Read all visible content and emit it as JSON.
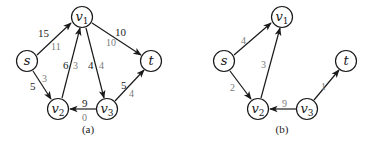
{
  "colors": {
    "edge": "#1a1a1a",
    "capacity_label": "#1a1a1a",
    "flow_label": "#7a7a7a",
    "background": "#ffffff"
  },
  "graph_a": {
    "caption": "(a)",
    "nodes": {
      "s": {
        "label": "s",
        "sub": ""
      },
      "v1": {
        "label": "v",
        "sub": "1"
      },
      "v2": {
        "label": "v",
        "sub": "2"
      },
      "v3": {
        "label": "v",
        "sub": "3"
      },
      "t": {
        "label": "t",
        "sub": ""
      }
    },
    "edges": {
      "s_v1": {
        "from": "s",
        "to": "v1",
        "capacity": "15",
        "flow": "11"
      },
      "s_v2": {
        "from": "s",
        "to": "v2",
        "capacity": "5",
        "flow": "3"
      },
      "v2_v1": {
        "from": "v2",
        "to": "v1",
        "capacity": "6",
        "flow": "3"
      },
      "v1_v3": {
        "from": "v1",
        "to": "v3",
        "capacity": "4",
        "flow": "4"
      },
      "v1_t": {
        "from": "v1",
        "to": "t",
        "capacity": "10",
        "flow": "10"
      },
      "v3_v2": {
        "from": "v3",
        "to": "v2",
        "capacity": "9",
        "flow": "0"
      },
      "v3_t": {
        "from": "v3",
        "to": "t",
        "capacity": "5",
        "flow": "4"
      }
    }
  },
  "graph_b": {
    "caption": "(b)",
    "nodes": {
      "s": {
        "label": "s",
        "sub": ""
      },
      "v1": {
        "label": "v",
        "sub": "1"
      },
      "v2": {
        "label": "v",
        "sub": "2"
      },
      "v3": {
        "label": "v",
        "sub": "3"
      },
      "t": {
        "label": "t",
        "sub": ""
      }
    },
    "edges": {
      "s_v1": {
        "from": "s",
        "to": "v1",
        "weight": "4"
      },
      "s_v2": {
        "from": "s",
        "to": "v2",
        "weight": "2"
      },
      "v2_v1": {
        "from": "v2",
        "to": "v1",
        "weight": "3"
      },
      "v3_v2": {
        "from": "v3",
        "to": "v2",
        "weight": "9"
      },
      "v3_t": {
        "from": "v3",
        "to": "t",
        "weight": "1"
      }
    }
  }
}
